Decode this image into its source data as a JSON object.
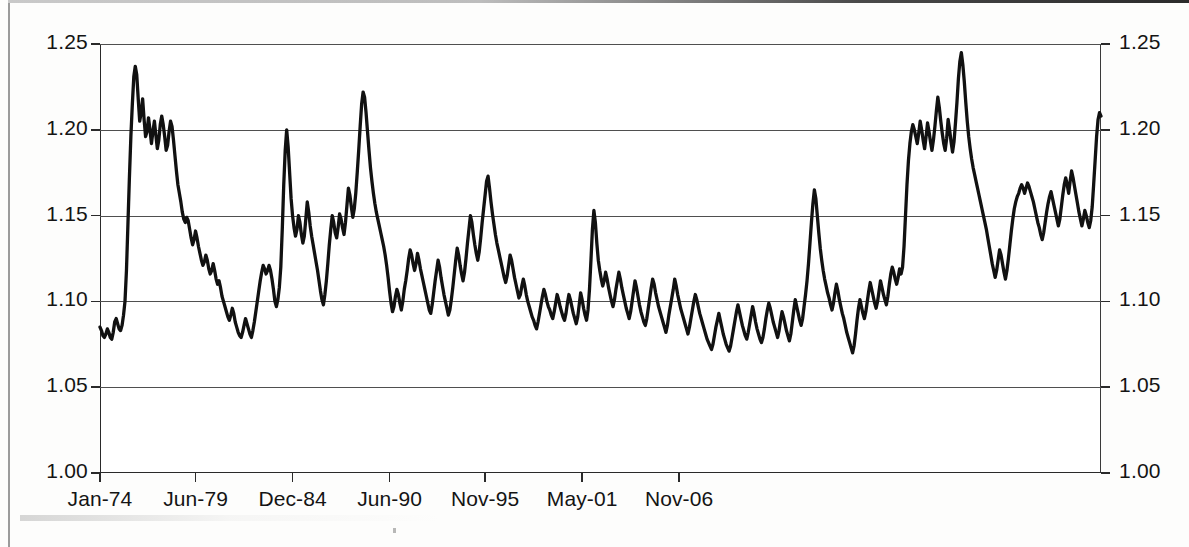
{
  "chart_data": {
    "type": "line",
    "title": "",
    "subtitle": "",
    "xlabel": "",
    "ylabel": "",
    "xlim_labels": [
      "Jan-74",
      "Nov-06"
    ],
    "ylim": [
      1.0,
      1.25
    ],
    "y_ticks": [
      "1.00",
      "1.05",
      "1.10",
      "1.15",
      "1.20",
      "1.25"
    ],
    "y_tick_values": [
      1.0,
      1.05,
      1.1,
      1.15,
      1.2,
      1.25
    ],
    "y_axis_right_ticks": [
      "1.00",
      "1.05",
      "1.10",
      "1.15",
      "1.20",
      "1.25"
    ],
    "x_ticks": [
      "Jan-74",
      "Jun-79",
      "Dec-84",
      "Jun-90",
      "Nov-95",
      "May-01",
      "Nov-06"
    ],
    "x_tick_positions": [
      0,
      65,
      131,
      197,
      262,
      328,
      394
    ],
    "grid": "horizontal",
    "legend": "none",
    "series": [
      {
        "name": "series-1",
        "color": "#111111",
        "x_start_label": "Jan-74",
        "x_step_months": 1,
        "values": [
          1.085,
          1.083,
          1.08,
          1.079,
          1.081,
          1.084,
          1.082,
          1.079,
          1.078,
          1.082,
          1.088,
          1.09,
          1.087,
          1.084,
          1.083,
          1.086,
          1.092,
          1.1,
          1.118,
          1.145,
          1.172,
          1.196,
          1.215,
          1.231,
          1.237,
          1.232,
          1.218,
          1.205,
          1.21,
          1.218,
          1.206,
          1.196,
          1.199,
          1.207,
          1.2,
          1.192,
          1.199,
          1.205,
          1.197,
          1.189,
          1.194,
          1.203,
          1.208,
          1.203,
          1.196,
          1.188,
          1.191,
          1.199,
          1.205,
          1.202,
          1.194,
          1.185,
          1.176,
          1.168,
          1.163,
          1.158,
          1.152,
          1.148,
          1.146,
          1.149,
          1.147,
          1.142,
          1.137,
          1.133,
          1.136,
          1.141,
          1.137,
          1.132,
          1.128,
          1.124,
          1.121,
          1.123,
          1.127,
          1.124,
          1.119,
          1.116,
          1.118,
          1.122,
          1.118,
          1.113,
          1.11,
          1.112,
          1.108,
          1.103,
          1.1,
          1.097,
          1.094,
          1.091,
          1.089,
          1.092,
          1.096,
          1.093,
          1.088,
          1.085,
          1.082,
          1.08,
          1.079,
          1.082,
          1.086,
          1.09,
          1.087,
          1.084,
          1.081,
          1.079,
          1.083,
          1.088,
          1.094,
          1.1,
          1.106,
          1.112,
          1.117,
          1.121,
          1.119,
          1.116,
          1.118,
          1.121,
          1.118,
          1.113,
          1.107,
          1.1,
          1.097,
          1.101,
          1.108,
          1.12,
          1.142,
          1.168,
          1.188,
          1.2,
          1.19,
          1.175,
          1.16,
          1.15,
          1.143,
          1.138,
          1.142,
          1.15,
          1.146,
          1.139,
          1.134,
          1.138,
          1.148,
          1.158,
          1.152,
          1.144,
          1.138,
          1.133,
          1.128,
          1.123,
          1.118,
          1.112,
          1.106,
          1.101,
          1.098,
          1.104,
          1.112,
          1.122,
          1.133,
          1.142,
          1.15,
          1.146,
          1.14,
          1.137,
          1.143,
          1.151,
          1.148,
          1.143,
          1.139,
          1.146,
          1.156,
          1.166,
          1.162,
          1.155,
          1.149,
          1.154,
          1.163,
          1.175,
          1.188,
          1.202,
          1.215,
          1.222,
          1.219,
          1.21,
          1.199,
          1.188,
          1.178,
          1.17,
          1.163,
          1.157,
          1.152,
          1.148,
          1.144,
          1.14,
          1.136,
          1.132,
          1.127,
          1.121,
          1.114,
          1.106,
          1.099,
          1.094,
          1.097,
          1.103,
          1.107,
          1.104,
          1.099,
          1.095,
          1.1,
          1.107,
          1.112,
          1.118,
          1.125,
          1.13,
          1.127,
          1.122,
          1.118,
          1.122,
          1.128,
          1.124,
          1.119,
          1.115,
          1.111,
          1.107,
          1.103,
          1.099,
          1.095,
          1.093,
          1.098,
          1.105,
          1.112,
          1.118,
          1.124,
          1.12,
          1.114,
          1.109,
          1.104,
          1.1,
          1.096,
          1.092,
          1.095,
          1.101,
          1.108,
          1.116,
          1.124,
          1.131,
          1.127,
          1.121,
          1.116,
          1.112,
          1.117,
          1.125,
          1.134,
          1.142,
          1.15,
          1.146,
          1.139,
          1.133,
          1.128,
          1.124,
          1.129,
          1.137,
          1.146,
          1.154,
          1.162,
          1.17,
          1.173,
          1.166,
          1.158,
          1.151,
          1.145,
          1.139,
          1.134,
          1.13,
          1.126,
          1.122,
          1.118,
          1.114,
          1.111,
          1.115,
          1.121,
          1.127,
          1.124,
          1.119,
          1.114,
          1.11,
          1.106,
          1.102,
          1.104,
          1.109,
          1.113,
          1.109,
          1.104,
          1.1,
          1.097,
          1.094,
          1.091,
          1.089,
          1.086,
          1.084,
          1.088,
          1.093,
          1.098,
          1.103,
          1.107,
          1.104,
          1.1,
          1.097,
          1.095,
          1.092,
          1.09,
          1.094,
          1.099,
          1.104,
          1.101,
          1.097,
          1.094,
          1.091,
          1.089,
          1.093,
          1.099,
          1.104,
          1.101,
          1.097,
          1.093,
          1.09,
          1.087,
          1.091,
          1.098,
          1.105,
          1.101,
          1.096,
          1.092,
          1.089,
          1.095,
          1.107,
          1.124,
          1.142,
          1.153,
          1.146,
          1.134,
          1.124,
          1.118,
          1.113,
          1.109,
          1.112,
          1.117,
          1.113,
          1.108,
          1.104,
          1.1,
          1.097,
          1.101,
          1.107,
          1.112,
          1.117,
          1.113,
          1.108,
          1.104,
          1.1,
          1.096,
          1.093,
          1.09,
          1.094,
          1.1,
          1.106,
          1.112,
          1.108,
          1.103,
          1.098,
          1.094,
          1.091,
          1.088,
          1.086,
          1.09,
          1.096,
          1.102,
          1.108,
          1.113,
          1.11,
          1.105,
          1.101,
          1.097,
          1.094,
          1.091,
          1.088,
          1.085,
          1.082,
          1.086,
          1.092,
          1.097,
          1.102,
          1.107,
          1.113,
          1.109,
          1.104,
          1.1,
          1.096,
          1.093,
          1.09,
          1.087,
          1.084,
          1.081,
          1.085,
          1.09,
          1.095,
          1.1,
          1.104,
          1.101,
          1.097,
          1.093,
          1.09,
          1.087,
          1.084,
          1.081,
          1.078,
          1.076,
          1.074,
          1.072,
          1.075,
          1.08,
          1.085,
          1.089,
          1.093,
          1.089,
          1.085,
          1.081,
          1.078,
          1.075,
          1.073,
          1.071,
          1.074,
          1.079,
          1.084,
          1.089,
          1.094,
          1.098,
          1.094,
          1.09,
          1.086,
          1.083,
          1.08,
          1.078,
          1.082,
          1.087,
          1.092,
          1.097,
          1.093,
          1.088,
          1.084,
          1.081,
          1.078,
          1.076,
          1.079,
          1.084,
          1.09,
          1.095,
          1.099,
          1.096,
          1.092,
          1.088,
          1.085,
          1.082,
          1.079,
          1.083,
          1.089,
          1.094,
          1.091,
          1.087,
          1.083,
          1.08,
          1.077,
          1.081,
          1.088,
          1.095,
          1.101,
          1.097,
          1.093,
          1.089,
          1.086,
          1.09,
          1.097,
          1.104,
          1.112,
          1.122,
          1.134,
          1.146,
          1.157,
          1.165,
          1.16,
          1.15,
          1.14,
          1.131,
          1.124,
          1.118,
          1.113,
          1.109,
          1.105,
          1.102,
          1.098,
          1.095,
          1.099,
          1.105,
          1.11,
          1.106,
          1.101,
          1.097,
          1.093,
          1.09,
          1.086,
          1.082,
          1.079,
          1.076,
          1.073,
          1.07,
          1.074,
          1.081,
          1.089,
          1.096,
          1.101,
          1.097,
          1.093,
          1.09,
          1.094,
          1.1,
          1.106,
          1.111,
          1.107,
          1.103,
          1.099,
          1.096,
          1.1,
          1.106,
          1.112,
          1.108,
          1.104,
          1.101,
          1.098,
          1.103,
          1.11,
          1.116,
          1.12,
          1.117,
          1.113,
          1.11,
          1.114,
          1.119,
          1.116,
          1.12,
          1.132,
          1.15,
          1.168,
          1.182,
          1.192,
          1.199,
          1.203,
          1.2,
          1.196,
          1.192,
          1.198,
          1.205,
          1.2,
          1.194,
          1.189,
          1.196,
          1.204,
          1.199,
          1.193,
          1.188,
          1.194,
          1.202,
          1.211,
          1.219,
          1.213,
          1.205,
          1.198,
          1.192,
          1.188,
          1.195,
          1.206,
          1.2,
          1.193,
          1.187,
          1.193,
          1.204,
          1.216,
          1.23,
          1.24,
          1.245,
          1.238,
          1.228,
          1.216,
          1.205,
          1.196,
          1.189,
          1.183,
          1.178,
          1.174,
          1.17,
          1.166,
          1.162,
          1.158,
          1.154,
          1.15,
          1.146,
          1.142,
          1.137,
          1.132,
          1.127,
          1.122,
          1.118,
          1.114,
          1.118,
          1.124,
          1.13,
          1.127,
          1.122,
          1.117,
          1.113,
          1.118,
          1.125,
          1.133,
          1.141,
          1.148,
          1.154,
          1.158,
          1.161,
          1.163,
          1.166,
          1.168,
          1.166,
          1.163,
          1.166,
          1.169,
          1.167,
          1.164,
          1.161,
          1.158,
          1.154,
          1.15,
          1.146,
          1.143,
          1.139,
          1.136,
          1.14,
          1.146,
          1.152,
          1.157,
          1.161,
          1.164,
          1.16,
          1.156,
          1.152,
          1.148,
          1.144,
          1.148,
          1.155,
          1.162,
          1.168,
          1.172,
          1.168,
          1.163,
          1.17,
          1.176,
          1.172,
          1.167,
          1.162,
          1.157,
          1.152,
          1.148,
          1.144,
          1.148,
          1.153,
          1.15,
          1.146,
          1.143,
          1.147,
          1.155,
          1.168,
          1.182,
          1.196,
          1.206,
          1.21,
          1.208
        ]
      }
    ]
  }
}
